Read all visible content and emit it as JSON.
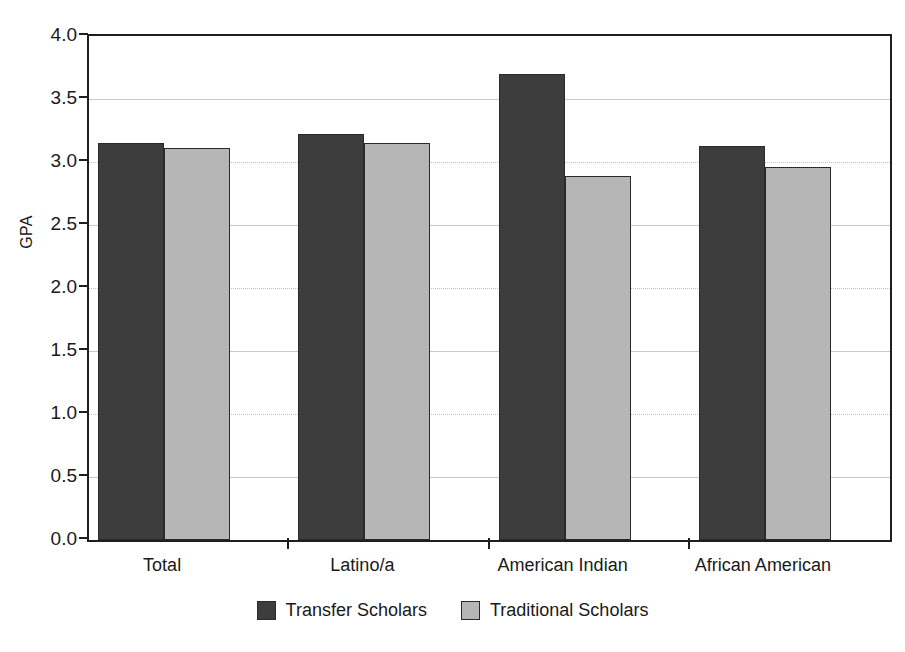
{
  "chart_data": {
    "type": "bar",
    "title": "",
    "xlabel": "",
    "ylabel": "GPA",
    "ylim": [
      0.0,
      4.0
    ],
    "ytick_labels": [
      "0.0",
      "0.5",
      "1.0",
      "1.5",
      "2.0",
      "2.5",
      "3.0",
      "3.5",
      "4.0"
    ],
    "ytick_values": [
      0.0,
      0.5,
      1.0,
      1.5,
      2.0,
      2.5,
      3.0,
      3.5,
      4.0
    ],
    "grid": true,
    "legend_position": "bottom-center",
    "categories": [
      "Total",
      "Latino/a",
      "American Indian",
      "African American"
    ],
    "series": [
      {
        "name": "Transfer Scholars",
        "color": "#3d3d3d",
        "values": [
          3.15,
          3.22,
          3.7,
          3.13
        ]
      },
      {
        "name": "Traditional Scholars",
        "color": "#b6b6b6",
        "values": [
          3.11,
          3.15,
          2.89,
          2.96
        ]
      }
    ]
  },
  "axes": {
    "y_title": "GPA"
  },
  "colors": {
    "transfer": "#3d3d3d",
    "traditional": "#b6b6b6",
    "axis": "#1f1f1f",
    "grid": "#c9c9c9",
    "background": "#ffffff"
  }
}
